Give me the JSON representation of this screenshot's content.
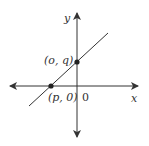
{
  "diagram": {
    "type": "coordinate-plane",
    "axes": {
      "x_label": "x",
      "y_label": "y",
      "origin_label": "0"
    },
    "line": {
      "description": "line with positive slope through two marked points"
    },
    "points": [
      {
        "label": "(p, 0)",
        "role": "x-intercept"
      },
      {
        "label": "(o, q)",
        "role": "y-intercept"
      }
    ],
    "colors": {
      "stroke": "#333333",
      "background": "#ffffff"
    }
  }
}
